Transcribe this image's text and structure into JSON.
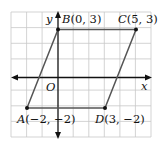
{
  "figure": {
    "type": "coordinate-plane-parallelogram",
    "grid": {
      "x_min": -3,
      "x_max": 6,
      "y_min": -4,
      "y_max": 4
    },
    "axes": {
      "x_label": "x",
      "y_label": "y",
      "origin_label": "O"
    },
    "points": [
      {
        "name": "A",
        "x": -2,
        "y": -2,
        "label": "A(−2, −2)"
      },
      {
        "name": "B",
        "x": 0,
        "y": 3,
        "label": "B(0, 3)"
      },
      {
        "name": "C",
        "x": 5,
        "y": 3,
        "label": "C(5, 3)"
      },
      {
        "name": "D",
        "x": 3,
        "y": -2,
        "label": "D(3, −2)"
      }
    ],
    "polygon": [
      "A",
      "B",
      "C",
      "D"
    ],
    "colors": {
      "grid": "#c8c8c8",
      "axis": "#111111",
      "edge": "#555555"
    }
  }
}
